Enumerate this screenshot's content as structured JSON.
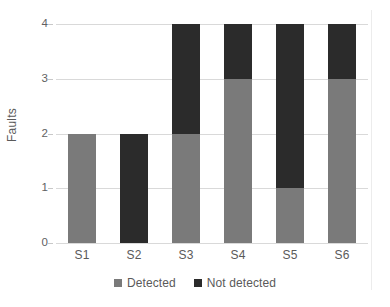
{
  "chart_data": {
    "type": "bar",
    "subtype": "stacked-vertical",
    "title": "",
    "xlabel": "",
    "ylabel": "Faults",
    "categories": [
      "S1",
      "S2",
      "S3",
      "S4",
      "S5",
      "S6"
    ],
    "series": [
      {
        "name": "Detected",
        "color": "#7a7a7a",
        "values": [
          2,
          0,
          2,
          3,
          1,
          3
        ]
      },
      {
        "name": "Not detected",
        "color": "#2b2b2b",
        "values": [
          0,
          2,
          2,
          1,
          3,
          1
        ]
      }
    ],
    "totals": [
      2,
      2,
      4,
      4,
      4,
      4
    ],
    "ylim": [
      0,
      4
    ],
    "y_ticks": [
      0,
      1,
      2,
      3,
      4
    ],
    "y_tick_labels": [
      "0",
      "1",
      "2",
      "3",
      "4"
    ],
    "grid": true,
    "grid_axis": "y",
    "grid_color": "#d9d9d9",
    "legend_position": "bottom",
    "legend_entries": [
      "Detected",
      "Not detected"
    ],
    "background": "#ffffff"
  },
  "axes": {
    "y_title": "Faults",
    "y_tick_labels": [
      "0",
      "1",
      "2",
      "3",
      "4"
    ],
    "x_tick_labels": [
      "S1",
      "S2",
      "S3",
      "S4",
      "S5",
      "S6"
    ]
  },
  "legend": {
    "items": [
      {
        "label": "Detected",
        "color": "#7a7a7a"
      },
      {
        "label": "Not detected",
        "color": "#2b2b2b"
      }
    ]
  }
}
